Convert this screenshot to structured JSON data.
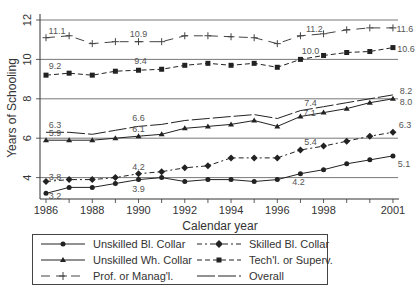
{
  "chart_data": {
    "type": "line",
    "title": "",
    "xlabel": "Calendar year",
    "ylabel": "Years of Schooling",
    "x": [
      1986,
      1987,
      1988,
      1989,
      1990,
      1991,
      1992,
      1993,
      1994,
      1995,
      1996,
      1997,
      1998,
      1999,
      2000,
      2001
    ],
    "x_tick_labels": [
      "1986",
      "1988",
      "1990",
      "1992",
      "1994",
      "1996",
      "1998",
      "2001"
    ],
    "y_tick_labels": [
      "4",
      "6",
      "8",
      "10",
      "12"
    ],
    "ylim": [
      3,
      12.2
    ],
    "grid": "horizontal",
    "legend_position": "bottom",
    "series": [
      {
        "name": "Unskilled Bl. Collar",
        "style": "solid",
        "marker": "circle",
        "values": [
          3.2,
          3.5,
          3.5,
          3.7,
          3.9,
          4.0,
          3.8,
          3.9,
          3.9,
          3.8,
          3.9,
          4.2,
          4.4,
          4.7,
          4.9,
          5.1
        ]
      },
      {
        "name": "Skilled Bl. Collar",
        "style": "dashdot",
        "marker": "diamond",
        "values": [
          3.8,
          3.9,
          3.9,
          4.0,
          4.2,
          4.3,
          4.5,
          4.6,
          5.0,
          5.0,
          5.0,
          5.4,
          5.6,
          5.85,
          6.1,
          6.3
        ]
      },
      {
        "name": "Unskilled Wh. Collar",
        "style": "solid",
        "marker": "triangle",
        "values": [
          5.9,
          5.9,
          5.9,
          6.0,
          6.1,
          6.2,
          6.5,
          6.6,
          6.7,
          6.9,
          6.6,
          7.1,
          7.3,
          7.5,
          7.8,
          8.0
        ]
      },
      {
        "name": "Tech'l. or Superv.",
        "style": "dashed",
        "marker": "square",
        "values": [
          9.2,
          9.3,
          9.2,
          9.4,
          9.45,
          9.5,
          9.7,
          9.8,
          9.7,
          9.8,
          9.6,
          10.0,
          10.2,
          10.35,
          10.4,
          10.6
        ]
      },
      {
        "name": "Prof. or Manag'l.",
        "style": "longdash-short",
        "marker": "plus",
        "values": [
          11.1,
          11.2,
          10.8,
          10.9,
          10.9,
          10.9,
          11.2,
          11.2,
          11.15,
          11.1,
          10.8,
          11.2,
          11.3,
          11.5,
          11.6,
          11.6
        ]
      },
      {
        "name": "Overall",
        "style": "longdash",
        "marker": "none",
        "values": [
          6.3,
          6.3,
          6.2,
          6.4,
          6.6,
          6.7,
          6.9,
          7.0,
          7.1,
          7.2,
          7.0,
          7.4,
          7.6,
          7.8,
          8.0,
          8.2
        ]
      }
    ],
    "annotations": [
      {
        "series": "Prof. or Manag'l.",
        "x": 1986,
        "text": "11.1"
      },
      {
        "series": "Prof. or Manag'l.",
        "x": 1990,
        "text": "10.9"
      },
      {
        "series": "Prof. or Manag'l.",
        "x": 1997,
        "text": "11.2"
      },
      {
        "series": "Prof. or Manag'l.",
        "x": 2001,
        "text": "11.6"
      },
      {
        "series": "Tech'l. or Superv.",
        "x": 1986,
        "text": "9.2"
      },
      {
        "series": "Tech'l. or Superv.",
        "x": 1990,
        "text": "9.4"
      },
      {
        "series": "Tech'l. or Superv.",
        "x": 1997,
        "text": "10.0"
      },
      {
        "series": "Tech'l. or Superv.",
        "x": 2001,
        "text": "10.6"
      },
      {
        "series": "Overall",
        "x": 1986,
        "text": "6.3"
      },
      {
        "series": "Overall",
        "x": 1990,
        "text": "6.6"
      },
      {
        "series": "Overall",
        "x": 1997,
        "text": "7.4"
      },
      {
        "series": "Overall",
        "x": 2001,
        "text": "8.2"
      },
      {
        "series": "Unskilled Wh. Collar",
        "x": 1986,
        "text": "5.9"
      },
      {
        "series": "Unskilled Wh. Collar",
        "x": 1990,
        "text": "6.1"
      },
      {
        "series": "Unskilled Wh. Collar",
        "x": 1997,
        "text": "7.1"
      },
      {
        "series": "Unskilled Wh. Collar",
        "x": 2001,
        "text": "8.0"
      },
      {
        "series": "Skilled Bl. Collar",
        "x": 1986,
        "text": "3.8"
      },
      {
        "series": "Skilled Bl. Collar",
        "x": 1990,
        "text": "4.2"
      },
      {
        "series": "Skilled Bl. Collar",
        "x": 1997,
        "text": "5.4"
      },
      {
        "series": "Skilled Bl. Collar",
        "x": 2001,
        "text": "6.3"
      },
      {
        "series": "Unskilled Bl. Collar",
        "x": 1986,
        "text": "3.2"
      },
      {
        "series": "Unskilled Bl. Collar",
        "x": 1990,
        "text": "3.9"
      },
      {
        "series": "Unskilled Bl. Collar",
        "x": 1997,
        "text": "4.2"
      },
      {
        "series": "Unskilled Bl. Collar",
        "x": 2001,
        "text": "5.1"
      }
    ]
  },
  "legend": {
    "items": [
      {
        "label": "Unskilled Bl. Collar"
      },
      {
        "label": "Skilled Bl. Collar"
      },
      {
        "label": "Unskilled Wh. Collar"
      },
      {
        "label": "Tech'l. or Superv."
      },
      {
        "label": "Prof. or Manag'l."
      },
      {
        "label": "Overall"
      }
    ]
  },
  "colors": {
    "line": "#222222",
    "grid": "#555555",
    "text": "#333333"
  }
}
